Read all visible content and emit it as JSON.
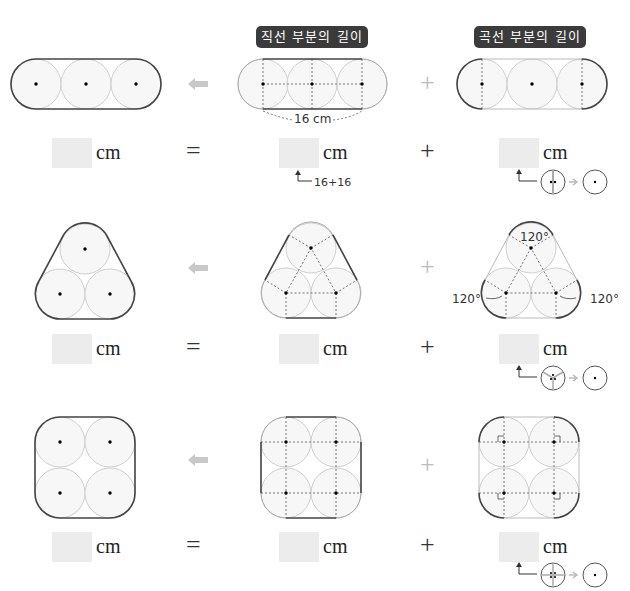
{
  "headers": {
    "straight": "직선 부분의 길이",
    "curved": "곡선 부분의 길이"
  },
  "operators": {
    "equals": "=",
    "plus": "+",
    "arrow": "⬅"
  },
  "unit": "cm",
  "rows": [
    {
      "shape": "three-circles-in-line",
      "dimension_label": "16 cm",
      "straight_hint": "16+16",
      "curve_hint": "two halves → one circle"
    },
    {
      "shape": "three-circles-triangle",
      "angle_labels": [
        "120°",
        "120°",
        "120°"
      ],
      "curve_hint": "three thirds → one circle"
    },
    {
      "shape": "four-circles-square",
      "curve_hint": "four quarters → one circle"
    }
  ]
}
